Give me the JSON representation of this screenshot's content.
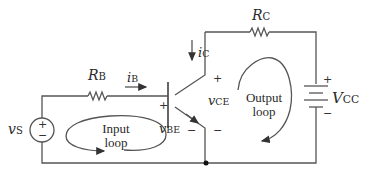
{
  "diagram": {
    "colors": {
      "wire": "#555555",
      "text": "#2a2a2a",
      "background": "#ffffff"
    },
    "components": {
      "source": {
        "symbol": "v",
        "sub": "S",
        "plus": "+",
        "minus": "−"
      },
      "base_resistor": {
        "symbol": "R",
        "sub": "B"
      },
      "collector_resistor": {
        "symbol": "R",
        "sub": "C"
      },
      "supply": {
        "symbol": "V",
        "sub": "CC",
        "plus": "+",
        "minus": "−"
      },
      "transistor": {
        "type": "NPN BJT"
      }
    },
    "currents": {
      "base": {
        "symbol": "i",
        "sub": "B"
      },
      "collector": {
        "symbol": "i",
        "sub": "C"
      }
    },
    "voltages": {
      "vbe": {
        "symbol": "v",
        "sub": "BE",
        "plus": "+",
        "minus": "−"
      },
      "vce": {
        "symbol": "v",
        "sub": "CE",
        "plus": "+",
        "minus": "−"
      }
    },
    "loops": {
      "input": {
        "line1": "Input",
        "line2": "loop"
      },
      "output": {
        "line1": "Output",
        "line2": "loop"
      }
    }
  }
}
